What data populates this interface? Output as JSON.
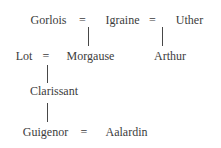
{
  "diagram": {
    "type": "family-tree",
    "labels": {
      "gorlois": "Gorlois",
      "igraine": "Igraine",
      "uther": "Uther",
      "lot": "Lot",
      "morgause": "Morgause",
      "arthur": "Arthur",
      "clarissant": "Clarissant",
      "guigenor": "Guigenor",
      "aalardin": "Aalardin",
      "equals": "="
    },
    "marriages": [
      {
        "a": "Gorlois",
        "b": "Igraine"
      },
      {
        "a": "Igraine",
        "b": "Uther"
      },
      {
        "a": "Lot",
        "b": "Morgause"
      },
      {
        "a": "Guigenor",
        "b": "Aalardin"
      }
    ],
    "parent_child_links": [
      {
        "parents": "Gorlois = Igraine",
        "child": "Morgause"
      },
      {
        "parents": "Igraine = Uther",
        "child": "Arthur"
      },
      {
        "parents": "Lot = Morgause",
        "child": "Clarissant"
      },
      {
        "parents": "Clarissant",
        "child": "Guigenor"
      }
    ],
    "colors": {
      "text": "#3c3c3c",
      "line": "#474747",
      "background": "#ffffff"
    }
  }
}
